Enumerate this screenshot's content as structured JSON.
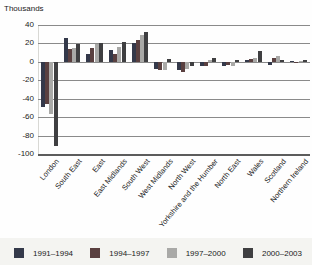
{
  "chart_data": {
    "type": "bar",
    "ylabel": "Thousands",
    "categories": [
      "London",
      "South East",
      "East",
      "East Midlands",
      "South West",
      "West Midlands",
      "North West",
      "Yorkshire and the Humber",
      "North East",
      "Wales",
      "Scotland",
      "Northern Ireland"
    ],
    "series": [
      {
        "name": "1991–1994",
        "color": "#34394a",
        "values": [
          -49,
          26,
          9,
          13,
          20,
          -8,
          -9,
          -5,
          -4,
          2,
          -3,
          1
        ]
      },
      {
        "name": "1994–1997",
        "color": "#5a4040",
        "values": [
          -46,
          14,
          15,
          9,
          24,
          -9,
          -11,
          -5,
          -3,
          3,
          4,
          -1
        ]
      },
      {
        "name": "1997–2000",
        "color": "#a9a9a7",
        "values": [
          -57,
          15,
          19,
          16,
          29,
          -9,
          -8,
          2,
          -4,
          4,
          6,
          1
        ]
      },
      {
        "name": "2000–2003",
        "color": "#3f3f41",
        "values": [
          -91,
          19,
          21,
          22,
          32,
          3,
          -4,
          4,
          2,
          12,
          2,
          2
        ]
      }
    ],
    "yticks": [
      40,
      20,
      0,
      -20,
      -40,
      -60,
      -80,
      -100
    ],
    "ylim": [
      -100,
      40
    ],
    "grid": "horizontal",
    "legend_position": "bottom"
  }
}
